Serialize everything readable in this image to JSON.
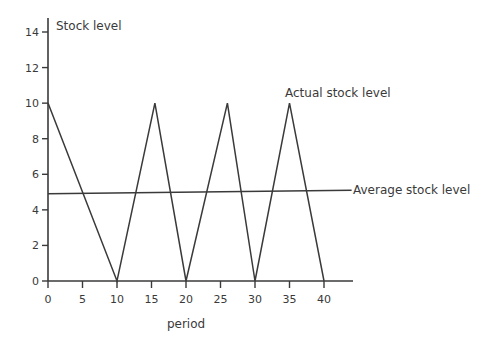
{
  "chart_data": {
    "type": "line",
    "title": "",
    "xlabel": "period",
    "ylabel": "Stock level",
    "xlim": [
      0,
      45
    ],
    "ylim": [
      0,
      15
    ],
    "x_ticks": [
      0,
      5,
      10,
      15,
      20,
      25,
      30,
      35,
      40
    ],
    "y_ticks": [
      0,
      2,
      4,
      6,
      8,
      10,
      12,
      14
    ],
    "grid": false,
    "series": [
      {
        "name": "Actual stock level",
        "x": [
          0,
          10,
          15.5,
          20,
          26,
          30,
          35,
          40
        ],
        "y": [
          10,
          0,
          10,
          0,
          10,
          0,
          10,
          0
        ]
      },
      {
        "name": "Average stock level",
        "x": [
          0,
          44
        ],
        "y": [
          4.9,
          5.1
        ]
      }
    ],
    "annotations": [
      {
        "text": "Actual stock level",
        "x": 35,
        "y": 10.5
      },
      {
        "text": "Average stock level",
        "x": 44,
        "y": 5.1
      }
    ]
  },
  "labels": {
    "ylabel": "Stock level",
    "xlabel": "period",
    "actual": "Actual stock level",
    "average": "Average stock level"
  },
  "colors": {
    "line": "#3a3a3a",
    "text": "#3a3a3a"
  }
}
